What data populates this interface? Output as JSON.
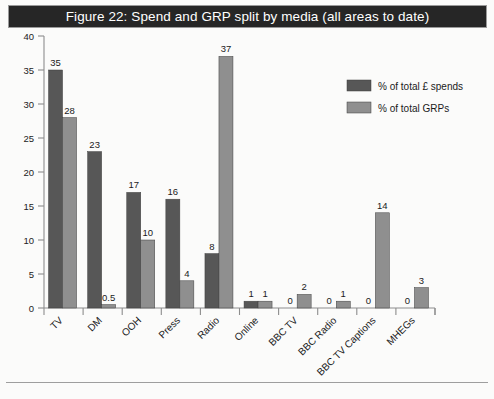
{
  "figure": {
    "title": "Figure 22: Spend and GRP split by media (all areas to date)"
  },
  "colors": {
    "series_spends": "#575757",
    "series_grps": "#8f8f8f",
    "title_bar_bg": "#262626",
    "title_text": "#ffffff",
    "axis": "#8d8d8d",
    "background": "#fbfbfa"
  },
  "legend": {
    "position": "inside-top-right",
    "entries": [
      {
        "label": "% of total £ spends",
        "color": "#575757"
      },
      {
        "label": "% of total GRPs",
        "color": "#8f8f8f"
      }
    ]
  },
  "axis": {
    "y_ticks": [
      "0",
      "5",
      "10",
      "15",
      "20",
      "25",
      "30",
      "35",
      "40"
    ]
  },
  "chart_data": {
    "type": "bar",
    "title": "Figure 22: Spend and GRP split by media (all areas to date)",
    "xlabel": "",
    "ylabel": "",
    "ylim": [
      0,
      40
    ],
    "ytick_step": 5,
    "grid": false,
    "legend_position": "inside-top-right",
    "categories": [
      "TV",
      "DM",
      "OOH",
      "Press",
      "Radio",
      "Online",
      "BBC TV",
      "BBC Radio",
      "BBC TV Captions",
      "MHEGs"
    ],
    "series": [
      {
        "name": "% of total £ spends",
        "color": "#575757",
        "values": [
          35,
          23,
          17,
          16,
          8,
          1,
          0,
          0,
          0,
          0
        ],
        "labels": [
          "35",
          "23",
          "17",
          "16",
          "8",
          "1",
          "0",
          "0",
          "0",
          "0"
        ]
      },
      {
        "name": "% of total GRPs",
        "color": "#8f8f8f",
        "values": [
          28,
          0.5,
          10,
          4,
          37,
          1,
          2,
          1,
          14,
          3
        ],
        "labels": [
          "28",
          "0.5",
          "10",
          "4",
          "37",
          "1",
          "2",
          "1",
          "14",
          "3"
        ]
      }
    ]
  }
}
